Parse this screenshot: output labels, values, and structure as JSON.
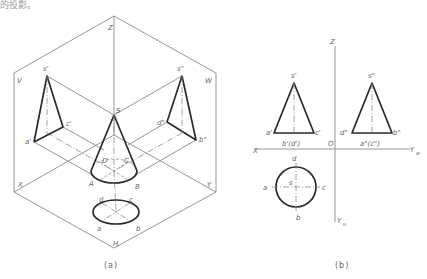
{
  "header": {
    "text": "的投影。"
  },
  "figure_a": {
    "caption": "(a)",
    "plane_labels": {
      "v": "V",
      "w": "W",
      "h": "H",
      "z": "Z",
      "x": "X",
      "y": "Y",
      "y2": "Y"
    },
    "cone_labels": {
      "s": "S",
      "a": "A",
      "b": "B",
      "c": "C",
      "d": "D"
    },
    "front_labels": {
      "s": "s'",
      "a": "a'",
      "c": "c'"
    },
    "side_labels": {
      "s": "s\"",
      "d": "d\"",
      "b": "b\""
    },
    "top_labels": {
      "a": "a",
      "b": "b",
      "c": "c",
      "d": "d"
    }
  },
  "figure_b": {
    "caption": "(b)",
    "axis_labels": {
      "z": "Z",
      "x": "X",
      "o": "O",
      "yw": "Y",
      "yw_sub": "W",
      "yh": "Y",
      "yh_sub": "H"
    },
    "front_labels": {
      "s": "s'",
      "a": "a'",
      "c": "c'",
      "bd": "b'(d')"
    },
    "side_labels": {
      "s": "s\"",
      "d": "d\"",
      "b": "b\"",
      "ac": "a\"(c\")"
    },
    "top_labels": {
      "s": "s",
      "a": "a",
      "b": "b",
      "c": "c",
      "d": "d"
    }
  }
}
